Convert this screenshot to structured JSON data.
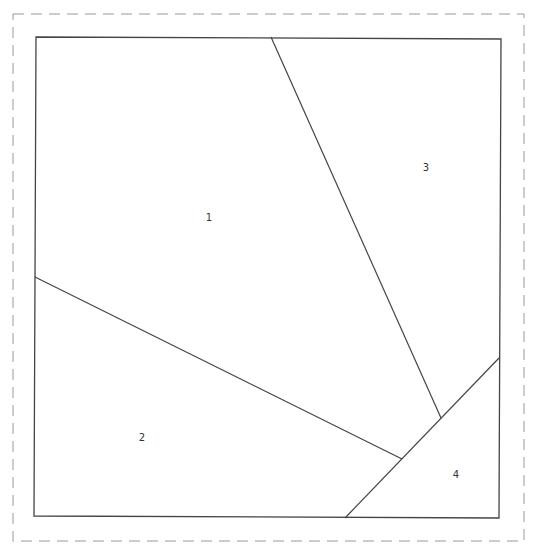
{
  "diagram": {
    "type": "quilt-block-pattern",
    "colors": {
      "background": "#ffffff",
      "outline": "#444444",
      "dashed_border": "#999999",
      "label": "#333333"
    },
    "seam_allowance_border": {
      "style": "dashed",
      "x1": 13,
      "y1": 14,
      "x2": 524,
      "y2": 541
    },
    "block_outline": {
      "points": [
        [
          36,
          37
        ],
        [
          501,
          39
        ],
        [
          499,
          518
        ],
        [
          34,
          516
        ]
      ]
    },
    "seam_lines": [
      {
        "id": "seam-a",
        "x1": 271,
        "y1": 37,
        "x2": 441,
        "y2": 418
      },
      {
        "id": "seam-b",
        "x1": 35,
        "y1": 277,
        "x2": 402,
        "y2": 459
      },
      {
        "id": "seam-c",
        "x1": 499,
        "y1": 358,
        "x2": 345,
        "y2": 518
      }
    ],
    "regions": [
      {
        "label": "1",
        "x": 209,
        "y": 221
      },
      {
        "label": "2",
        "x": 142,
        "y": 441
      },
      {
        "label": "3",
        "x": 426,
        "y": 171
      },
      {
        "label": "4",
        "x": 456,
        "y": 478
      }
    ]
  }
}
